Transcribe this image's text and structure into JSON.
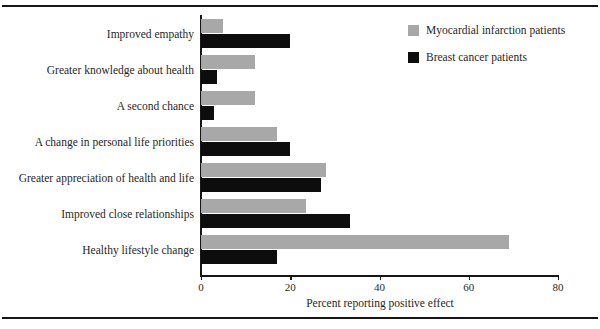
{
  "chart_data": {
    "type": "bar",
    "orientation": "horizontal",
    "title": "",
    "xlabel": "Percent reporting positive effect",
    "ylabel": "",
    "xlim": [
      0,
      80
    ],
    "xticks": [
      0,
      20,
      40,
      60,
      80
    ],
    "xtick_labels": [
      "0",
      "20",
      "40",
      "60",
      "80"
    ],
    "grid": false,
    "legend_position": "top-right",
    "categories": [
      "Improved empathy",
      "Greater knowledge about health",
      "A second chance",
      "A change in personal life priorities",
      "Greater appreciation of health and life",
      "Improved close relationships",
      "Healthy lifestyle change"
    ],
    "series": [
      {
        "name": "Myocardial infarction patients",
        "color": "#a8a8a8",
        "values": [
          5,
          12,
          12,
          17,
          28,
          23.5,
          69
        ]
      },
      {
        "name": "Breast cancer patients",
        "color": "#0d0d0d",
        "values": [
          20,
          3.5,
          3,
          20,
          27,
          33.5,
          17
        ]
      }
    ]
  },
  "legend": {
    "items": [
      {
        "label": "Myocardial infarction patients",
        "swatch": "mi"
      },
      {
        "label": "Breast cancer patients",
        "swatch": "bc"
      }
    ]
  }
}
